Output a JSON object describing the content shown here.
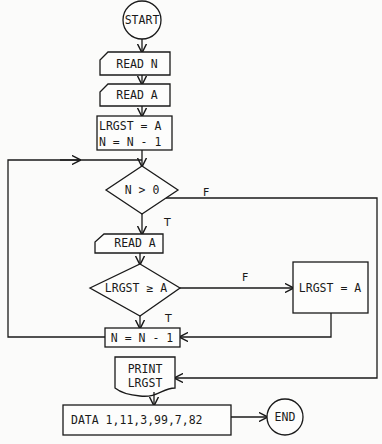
{
  "flowchart": {
    "nodes": {
      "start": {
        "type": "terminal",
        "label": "START"
      },
      "read_n": {
        "type": "input",
        "label": "READ N"
      },
      "read_a1": {
        "type": "input",
        "label": "READ A"
      },
      "init": {
        "type": "process",
        "line1": "LRGST = A",
        "line2": "N = N - 1"
      },
      "cond_n": {
        "type": "decision",
        "label": "N > 0"
      },
      "read_a2": {
        "type": "input",
        "label": "READ A"
      },
      "cond_lrgst": {
        "type": "decision",
        "label": "LRGST ≥ A"
      },
      "assign": {
        "type": "process",
        "label": "LRGST = A"
      },
      "decrement": {
        "type": "process",
        "label": "N = N - 1"
      },
      "print": {
        "type": "output",
        "line1": "PRINT",
        "line2": "LRGST"
      },
      "data": {
        "type": "process",
        "label": "DATA 1,11,3,99,7,82"
      },
      "end": {
        "type": "terminal",
        "label": "END"
      }
    },
    "edge_labels": {
      "cond_n_true": "T",
      "cond_n_false": "F",
      "cond_lrgst_true": "T",
      "cond_lrgst_false": "F"
    },
    "edges": [
      {
        "from": "start",
        "to": "read_n"
      },
      {
        "from": "read_n",
        "to": "read_a1"
      },
      {
        "from": "read_a1",
        "to": "init"
      },
      {
        "from": "init",
        "to": "cond_n"
      },
      {
        "from": "cond_n",
        "to": "read_a2",
        "label": "T"
      },
      {
        "from": "cond_n",
        "to": "print",
        "label": "F"
      },
      {
        "from": "read_a2",
        "to": "cond_lrgst"
      },
      {
        "from": "cond_lrgst",
        "to": "decrement",
        "label": "T"
      },
      {
        "from": "cond_lrgst",
        "to": "assign",
        "label": "F"
      },
      {
        "from": "assign",
        "to": "decrement"
      },
      {
        "from": "decrement",
        "to": "cond_n"
      },
      {
        "from": "print",
        "to": "data"
      },
      {
        "from": "data",
        "to": "end"
      }
    ]
  }
}
